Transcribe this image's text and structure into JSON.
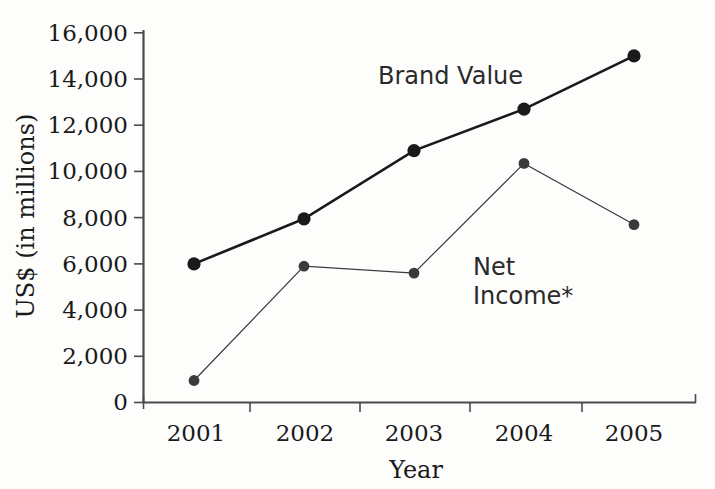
{
  "chart_data": {
    "type": "line",
    "title": "",
    "xlabel": "Year",
    "ylabel": "US$ (in millions)",
    "categories": [
      "2001",
      "2002",
      "2003",
      "2004",
      "2005"
    ],
    "x_tick_labels": [
      "2001",
      "2002",
      "2003",
      "2004",
      "2005"
    ],
    "y_tick_labels": [
      "0",
      "2,000",
      "4,000",
      "6,000",
      "8,000",
      "10,000",
      "12,000",
      "14,000",
      "16,000"
    ],
    "y_ticks": [
      0,
      2000,
      4000,
      6000,
      8000,
      10000,
      12000,
      14000,
      16000
    ],
    "ylim": [
      0,
      16000
    ],
    "grid": false,
    "legend_position": "inline-annotation",
    "series": [
      {
        "name": "Brand Value",
        "label": "Brand Value",
        "color": "#1a1a1a",
        "line_width": 2.6,
        "marker": "circle",
        "values": [
          6000,
          7950,
          10900,
          12700,
          15000
        ]
      },
      {
        "name": "Net Income",
        "label_line1": "Net",
        "label_line2": "Income*",
        "label": "Net Income*",
        "color": "#3a3a3a",
        "line_width": 1.2,
        "marker": "circle",
        "values": [
          950,
          5900,
          5600,
          10350,
          7700
        ]
      }
    ],
    "annotations": [
      {
        "text": "Brand Value",
        "series": "Brand Value"
      },
      {
        "text": "Net Income*",
        "series": "Net Income"
      }
    ],
    "footnote_marker": "*"
  },
  "axes": {
    "x_axis_name": "year-axis",
    "y_axis_name": "value-axis"
  }
}
